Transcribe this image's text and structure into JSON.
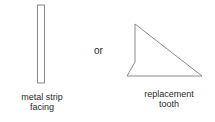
{
  "diagram": {
    "left": {
      "shape": "metal-strip",
      "label_lines": [
        "metal strip",
        "facing"
      ]
    },
    "connector": "or",
    "right": {
      "shape": "replacement-tooth-triangle",
      "label_lines": [
        "replacement",
        "tooth"
      ]
    },
    "stroke_color": "#8a8a8a"
  }
}
